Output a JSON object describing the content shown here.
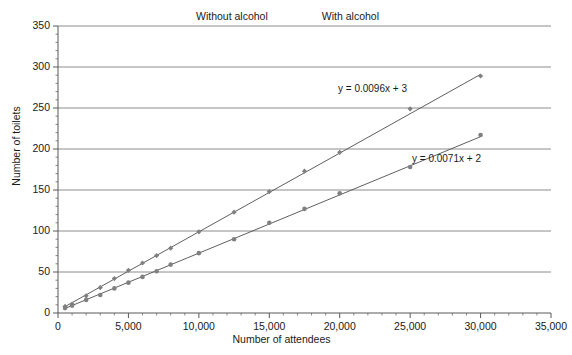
{
  "chart_data": {
    "type": "scatter",
    "title": "",
    "xlabel": "Number of attendees",
    "ylabel": "Number of toilets",
    "xlim": [
      0,
      35000
    ],
    "ylim": [
      0,
      350
    ],
    "xticks": [
      0,
      5000,
      10000,
      15000,
      20000,
      25000,
      30000,
      35000
    ],
    "xtick_labels": [
      "0",
      "5,000",
      "10,000",
      "15,000",
      "20,000",
      "25,000",
      "30,000",
      "35,000"
    ],
    "yticks": [
      0,
      50,
      100,
      150,
      200,
      250,
      300,
      350
    ],
    "ytick_labels": [
      "0",
      "50",
      "100",
      "150",
      "200",
      "250",
      "300",
      "350"
    ],
    "grid": "horizontal",
    "legend_position": "top-center",
    "series": [
      {
        "name": "Without alcohol",
        "marker": "diamond",
        "color": "#808080",
        "trendline_equation": "y = 0.0096x + 3",
        "trendline_slope": 0.0096,
        "trendline_intercept": 3,
        "x": [
          500,
          1000,
          2000,
          3000,
          4000,
          5000,
          6000,
          7000,
          8000,
          10000,
          12500,
          15000,
          17500,
          20000,
          25000,
          30000
        ],
        "y": [
          8,
          11,
          21,
          31,
          42,
          52,
          61,
          70,
          79,
          99,
          123,
          148,
          173,
          196,
          249,
          289
        ]
      },
      {
        "name": "With alcohol",
        "marker": "circle",
        "color": "#808080",
        "trendline_equation": "y = 0.0071x + 2",
        "trendline_slope": 0.0071,
        "trendline_intercept": 2,
        "x": [
          500,
          1000,
          2000,
          3000,
          4000,
          5000,
          6000,
          7000,
          8000,
          10000,
          12500,
          15000,
          17500,
          20000,
          25000,
          30000
        ],
        "y": [
          6,
          9,
          16,
          22,
          30,
          37,
          44,
          51,
          59,
          73,
          90,
          110,
          127,
          146,
          178,
          217
        ]
      }
    ],
    "annotations": [
      {
        "text": "y = 0.0096x + 3",
        "x_px": 338,
        "y_px": 83
      },
      {
        "text": "y = 0.0071x + 2",
        "x_px": 412,
        "y_px": 153
      }
    ]
  },
  "legend": {
    "items": [
      {
        "label": "Without alcohol",
        "marker": "diamond"
      },
      {
        "label": "With alcohol",
        "marker": "circle"
      }
    ]
  },
  "axes": {
    "x_title": "Number of attendees",
    "y_title": "Number of toilets"
  },
  "colors": {
    "series": "#808080",
    "grid": "#808080",
    "axis": "#595959",
    "text": "#1a1a1a"
  }
}
